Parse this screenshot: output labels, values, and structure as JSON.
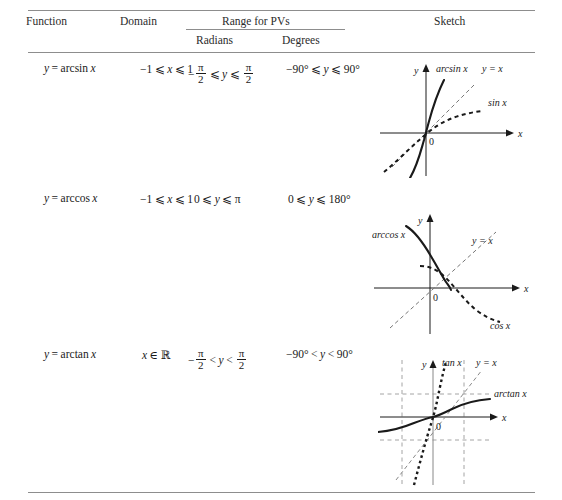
{
  "table": {
    "headers": {
      "function": "Function",
      "domain": "Domain",
      "range_group": "Range for PVs",
      "radians": "Radians",
      "degrees": "Degrees",
      "sketch": "Sketch"
    },
    "rows": [
      {
        "id": "arcsin",
        "function_lhs": "y",
        "function_eq": "=",
        "function_rhs": "arcsin",
        "function_var": "x",
        "domain": "−1 ⩽ x ⩽ 1",
        "domain_parts": {
          "low": "−1",
          "op1": "⩽",
          "var": "x",
          "op2": "⩽",
          "high": "1"
        },
        "radians": "−π/2 ⩽ y ⩽ π/2",
        "radians_parts": {
          "sign": "−",
          "num1": "π",
          "den1": "2",
          "op1": "⩽",
          "var": "y",
          "op2": "⩽",
          "num2": "π",
          "den2": "2"
        },
        "degrees": "−90° ⩽ y ⩽ 90°",
        "degrees_parts": {
          "low": "−90°",
          "op1": "⩽",
          "var": "y",
          "op2": "⩽",
          "high": "90°"
        },
        "sketch": {
          "name": "arcsin-sketch",
          "axis_x": "x",
          "axis_y": "y",
          "origin": "0",
          "curve_label": "arcsin x",
          "identity_label": "y = x",
          "dashed_label": "sin x"
        }
      },
      {
        "id": "arccos",
        "function_lhs": "y",
        "function_eq": "=",
        "function_rhs": "arccos",
        "function_var": "x",
        "domain": "−1 ⩽ x ⩽ 1",
        "domain_parts": {
          "low": "−1",
          "op1": "⩽",
          "var": "x",
          "op2": "⩽",
          "high": "1"
        },
        "radians": "0 ⩽ y ⩽ π",
        "radians_parts": {
          "low": "0",
          "op1": "⩽",
          "var": "y",
          "op2": "⩽",
          "high": "π"
        },
        "degrees": "0 ⩽ y ⩽ 180°",
        "degrees_parts": {
          "low": "0",
          "op1": "⩽",
          "var": "y",
          "op2": "⩽",
          "high": "180°"
        },
        "sketch": {
          "name": "arccos-sketch",
          "axis_x": "x",
          "axis_y": "y",
          "origin": "0",
          "curve_label": "arccos x",
          "identity_label": "y = x",
          "dashed_label": "cos x"
        }
      },
      {
        "id": "arctan",
        "function_lhs": "y",
        "function_eq": "=",
        "function_rhs": "arctan",
        "function_var": "x",
        "domain": "x ∈ ℝ",
        "domain_parts": {
          "var": "x",
          "op1": "∈",
          "set": "ℝ"
        },
        "radians": "−π/2 < y < π/2",
        "radians_parts": {
          "sign": "−",
          "num1": "π",
          "den1": "2",
          "op1": "<",
          "var": "y",
          "op2": "<",
          "num2": "π",
          "den2": "2"
        },
        "degrees": "−90° < y < 90°",
        "degrees_parts": {
          "low": "−90°",
          "op1": "<",
          "var": "y",
          "op2": "<",
          "high": "90°"
        },
        "sketch": {
          "name": "arctan-sketch",
          "axis_x": "x",
          "axis_y": "y",
          "origin": "0",
          "curve_label": "arctan x",
          "identity_label": "y = x",
          "dashed_label": "tan x"
        }
      }
    ]
  },
  "colors": {
    "rule": "#8d8d8d",
    "ink": "#1a1a1a",
    "grid_dash": "#9a9a9a"
  }
}
